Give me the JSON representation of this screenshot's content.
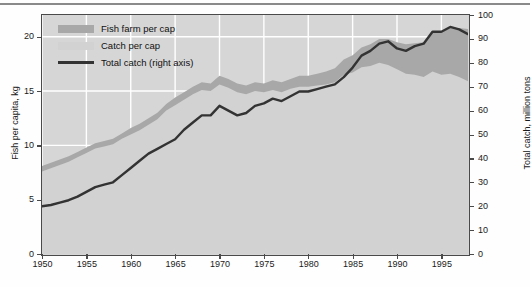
{
  "chart_data": {
    "type": "area",
    "title": "",
    "subtitle": "",
    "xlabel": "",
    "ylabel": "Fish per capita, kg",
    "ylabel_right": "Total catch, million tons",
    "xlim": [
      1950,
      1998
    ],
    "ylim": [
      0,
      22
    ],
    "ylim_right": [
      0,
      100
    ],
    "grid": true,
    "legend_position": "top-left",
    "x": [
      1950,
      1951,
      1952,
      1953,
      1954,
      1955,
      1956,
      1957,
      1958,
      1959,
      1960,
      1961,
      1962,
      1963,
      1964,
      1965,
      1966,
      1967,
      1968,
      1969,
      1970,
      1971,
      1972,
      1973,
      1974,
      1975,
      1976,
      1977,
      1978,
      1979,
      1980,
      1981,
      1982,
      1983,
      1984,
      1985,
      1986,
      1987,
      1988,
      1989,
      1990,
      1991,
      1992,
      1993,
      1994,
      1995,
      1996,
      1997,
      1998
    ],
    "yticks_left": [
      0,
      5,
      10,
      15,
      20
    ],
    "yticks_right": [
      0,
      10,
      20,
      30,
      40,
      50,
      60,
      70,
      80,
      90,
      100
    ],
    "xticks": [
      1950,
      1955,
      1960,
      1965,
      1970,
      1975,
      1980,
      1985,
      1990,
      1995
    ],
    "series": [
      {
        "name": "Catch per cap",
        "color": "#d2d2d2",
        "stack": "bottom",
        "axis": "left",
        "units": "kg",
        "values": [
          7.6,
          7.9,
          8.2,
          8.5,
          8.9,
          9.3,
          9.7,
          9.9,
          10.1,
          10.6,
          11.0,
          11.4,
          11.9,
          12.4,
          13.2,
          13.7,
          14.2,
          14.7,
          15.1,
          15.0,
          15.6,
          15.3,
          14.9,
          14.7,
          15.0,
          14.9,
          15.1,
          14.9,
          15.2,
          15.4,
          15.4,
          15.5,
          15.6,
          15.8,
          16.5,
          16.7,
          17.2,
          17.3,
          17.6,
          17.4,
          17.0,
          16.6,
          16.5,
          16.3,
          16.8,
          16.5,
          16.6,
          16.3,
          15.9
        ]
      },
      {
        "name": "Fish farm per cap",
        "color": "#a8a8a8",
        "stack": "top",
        "axis": "left",
        "units": "kg",
        "values": [
          0.5,
          0.5,
          0.5,
          0.5,
          0.5,
          0.5,
          0.5,
          0.5,
          0.5,
          0.5,
          0.6,
          0.6,
          0.6,
          0.6,
          0.6,
          0.7,
          0.7,
          0.7,
          0.7,
          0.7,
          0.8,
          0.8,
          0.8,
          0.8,
          0.8,
          0.8,
          0.9,
          0.9,
          0.9,
          1.0,
          1.0,
          1.1,
          1.2,
          1.3,
          1.4,
          1.6,
          1.8,
          2.0,
          2.2,
          2.4,
          2.5,
          2.7,
          2.9,
          3.2,
          3.6,
          3.9,
          4.2,
          4.5,
          4.8
        ]
      },
      {
        "name": "Total catch (right axis)",
        "color": "#333333",
        "type": "line",
        "axis": "right",
        "units": "million tons",
        "values": [
          20,
          20.5,
          21.5,
          22.5,
          24,
          26,
          28,
          29,
          30,
          33,
          36,
          39,
          42,
          44,
          46,
          48,
          52,
          55,
          58,
          58,
          62,
          60,
          58,
          59,
          62,
          63,
          65,
          64,
          66,
          68,
          68,
          69,
          70,
          71,
          74,
          78,
          83,
          85,
          88,
          89,
          86,
          85,
          87,
          88,
          93,
          93,
          95,
          94,
          92
        ]
      }
    ],
    "legend": [
      {
        "label": "Fish farm per cap",
        "color": "#a8a8a8",
        "marker": "swatch"
      },
      {
        "label": "Catch per cap",
        "color": "#d2d2d2",
        "marker": "swatch"
      },
      {
        "label": "Total catch (right axis)",
        "color": "#333333",
        "marker": "line"
      }
    ]
  },
  "axes": {
    "left_title": "Fish per capita, kg",
    "right_title": "Total catch, million tons",
    "left_ticks": [
      "0",
      "5",
      "10",
      "15",
      "20"
    ],
    "right_ticks": [
      "0",
      "10",
      "20",
      "30",
      "40",
      "50",
      "60",
      "70",
      "80",
      "90",
      "100"
    ],
    "x_ticks": [
      "1950",
      "1955",
      "1960",
      "1965",
      "1970",
      "1975",
      "1980",
      "1985",
      "1990",
      "1995"
    ]
  },
  "legend": {
    "items": [
      {
        "label": "Fish farm per cap"
      },
      {
        "label": "Catch per cap"
      },
      {
        "label": "Total catch (right axis)"
      }
    ]
  },
  "colors": {
    "catch_fill": "#d2d2d2",
    "farm_fill": "#a8a8a8",
    "line": "#333333",
    "plot_bg": "#d6d6d6",
    "grid": "#ffffff",
    "frame": "#4a4a4a"
  }
}
